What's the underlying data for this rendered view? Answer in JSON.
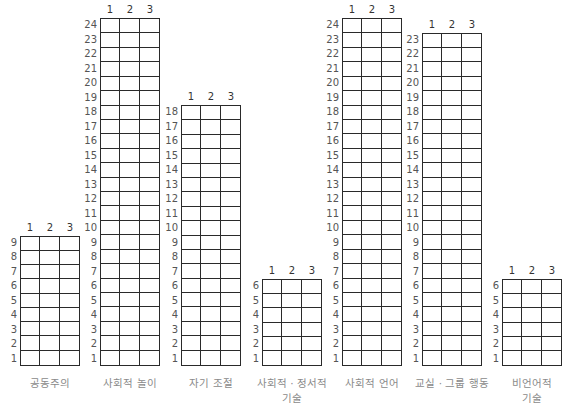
{
  "chart_data": {
    "type": "table",
    "title": "",
    "columns": [
      "1",
      "2",
      "3"
    ],
    "grids": [
      {
        "name": "공동주의",
        "rows": 9
      },
      {
        "name": "사회적 놀이",
        "rows": 24
      },
      {
        "name": "자기 조절",
        "rows": 18
      },
      {
        "name": "사회적 · 정서적\n기술",
        "rows": 6
      },
      {
        "name": "사회적 언어",
        "rows": 24
      },
      {
        "name": "교실 · 그룹 행동",
        "rows": 23
      },
      {
        "name": "비언어적\n기술",
        "rows": 6
      }
    ]
  },
  "layout": {
    "bottom": 366,
    "row_height": 14.5,
    "col_width": 20,
    "lefts": [
      20,
      100,
      181,
      262,
      342,
      422,
      502
    ]
  }
}
